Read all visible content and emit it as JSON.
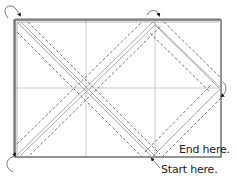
{
  "labels": {
    "end": "End here.",
    "start": "Start here."
  },
  "colors": {
    "border": "#5a5a5a",
    "grid": "#c8c8c8",
    "fold_line": "#aaaaaa",
    "dashed": "#6a6a6a",
    "arrow": "#1a1a1a",
    "text": "#222222"
  },
  "diagram": {
    "rectangle": {
      "x": 15,
      "y": 20,
      "width": 206,
      "height": 137
    },
    "grid_vertical_x": [
      86,
      155
    ],
    "grid_horizontal_y": [
      88
    ],
    "path_description": "Diamond-shaped binding/stitching path with solid fold lines and dashed stitching lines on either side, arrows indicating direction",
    "corner_turn_arrows": [
      "top-left",
      "top-center",
      "right-middle",
      "bottom-left"
    ]
  }
}
